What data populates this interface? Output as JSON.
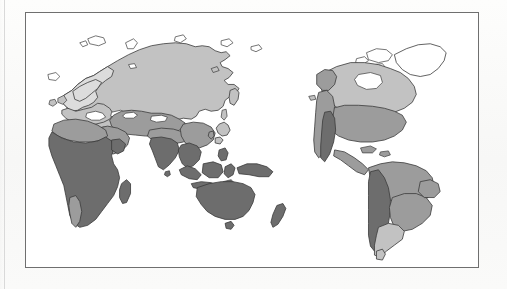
{
  "figure": {
    "type": "map",
    "title": "",
    "caption": "",
    "projection": "equirectangular",
    "center_longitude_deg": 60,
    "frame": {
      "border_color": "#6f6f6f",
      "background_color": "#ffffff",
      "x": 25,
      "y": 12,
      "width": 454,
      "height": 256
    },
    "page_background_color": "#fbfbfa",
    "ocean_color": "#ffffff",
    "coastline_color": "#3a3a3a"
  },
  "map_data": {
    "shading_scheme": "grayscale-zones",
    "zone_count": 5,
    "zones": [
      {
        "id": "zone-1",
        "label": "",
        "color": "#ffffff",
        "description": "unshaded / polar"
      },
      {
        "id": "zone-2",
        "label": "",
        "color": "#dcdcdc",
        "description": "very light gray"
      },
      {
        "id": "zone-3",
        "label": "",
        "color": "#c2c2c2",
        "description": "light gray"
      },
      {
        "id": "zone-4",
        "label": "",
        "color": "#9c9c9c",
        "description": "medium gray"
      },
      {
        "id": "zone-5",
        "label": "",
        "color": "#6d6d6d",
        "description": "dark gray"
      }
    ],
    "regions": [
      {
        "name": "scandinavia-nw-europe",
        "zone": "zone-2"
      },
      {
        "name": "northern-europe",
        "zone": "zone-3"
      },
      {
        "name": "siberia-northern-asia",
        "zone": "zone-3"
      },
      {
        "name": "central-asia-steppe",
        "zone": "zone-4"
      },
      {
        "name": "mediterranean-north-africa",
        "zone": "zone-4"
      },
      {
        "name": "sub-saharan-africa",
        "zone": "zone-5"
      },
      {
        "name": "southern-africa-strip",
        "zone": "zone-4"
      },
      {
        "name": "arabia-middle-east",
        "zone": "zone-4"
      },
      {
        "name": "india-subcontinent",
        "zone": "zone-5"
      },
      {
        "name": "southeast-asia",
        "zone": "zone-5"
      },
      {
        "name": "east-asia-china",
        "zone": "zone-4"
      },
      {
        "name": "japan-korea",
        "zone": "zone-3"
      },
      {
        "name": "indonesia-archipelago",
        "zone": "zone-5"
      },
      {
        "name": "new-guinea",
        "zone": "zone-5"
      },
      {
        "name": "australia",
        "zone": "zone-5"
      },
      {
        "name": "new-zealand",
        "zone": "zone-5"
      },
      {
        "name": "greenland-arctic",
        "zone": "zone-1"
      },
      {
        "name": "canada-boreal",
        "zone": "zone-3"
      },
      {
        "name": "alaska-coast",
        "zone": "zone-4"
      },
      {
        "name": "eastern-north-america",
        "zone": "zone-4"
      },
      {
        "name": "western-north-america-cordillera",
        "zone": "zone-4"
      },
      {
        "name": "southwest-north-america-arid",
        "zone": "zone-5"
      },
      {
        "name": "central-america-caribbean",
        "zone": "zone-4"
      },
      {
        "name": "amazonia-northern-south-america",
        "zone": "zone-4"
      },
      {
        "name": "andes",
        "zone": "zone-5"
      },
      {
        "name": "brazil-interior",
        "zone": "zone-4"
      },
      {
        "name": "southern-cone",
        "zone": "zone-3"
      }
    ],
    "landmasses": [
      "Eurasia",
      "Africa",
      "Australia",
      "North America",
      "South America",
      "Greenland",
      "Iceland",
      "British Isles",
      "Japan",
      "Madagascar",
      "New Guinea",
      "New Zealand",
      "Philippines",
      "Borneo",
      "Sumatra",
      "Java",
      "Sri Lanka",
      "Svalbard",
      "Novaya Zemlya",
      "Caribbean islands",
      "Tasmania"
    ]
  }
}
